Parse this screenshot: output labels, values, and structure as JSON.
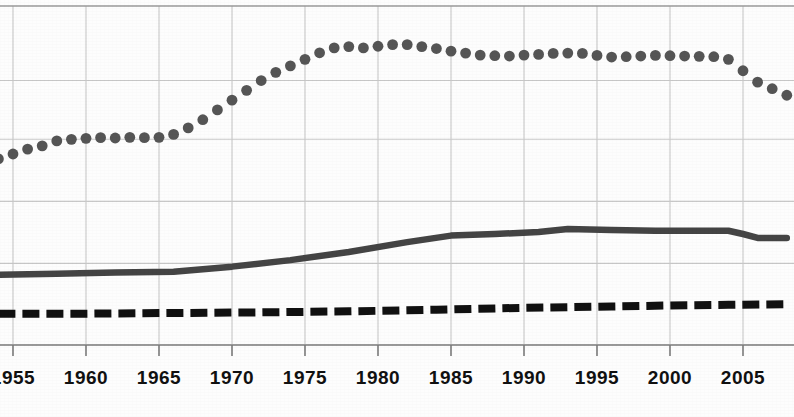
{
  "chart_data": {
    "type": "line",
    "title": "",
    "subtitle": "",
    "xlabel": "",
    "ylabel": "",
    "grid": true,
    "legend_position": "none",
    "xlim": [
      1953.5,
      2008.5
    ],
    "ylim": [
      0,
      100
    ],
    "x_tick_labels": [
      "1955",
      "1960",
      "1965",
      "1970",
      "1975",
      "1980",
      "1985",
      "1990",
      "1995",
      "2000",
      "2005"
    ],
    "x_tick_values": [
      1955,
      1960,
      1965,
      1970,
      1975,
      1980,
      1985,
      1990,
      1995,
      2000,
      2005
    ],
    "y_gridline_values": [
      25,
      44,
      63,
      81
    ],
    "series": [
      {
        "name": "dotted-series",
        "style": "dotted",
        "marker": "circle",
        "color": "#555555",
        "x": [
          1954,
          1955,
          1956,
          1957,
          1958,
          1959,
          1960,
          1961,
          1962,
          1963,
          1964,
          1965,
          1966,
          1967,
          1968,
          1969,
          1970,
          1971,
          1972,
          1973,
          1974,
          1975,
          1976,
          1977,
          1978,
          1979,
          1980,
          1981,
          1982,
          1983,
          1984,
          1985,
          1986,
          1987,
          1988,
          1989,
          1990,
          1991,
          1992,
          1993,
          1994,
          1995,
          1996,
          1997,
          1998,
          1999,
          2000,
          2001,
          2002,
          2003,
          2004,
          2005,
          2006,
          2007,
          2008
        ],
        "values": [
          57.0,
          58.5,
          60.0,
          61.0,
          62.5,
          63.0,
          63.3,
          63.5,
          63.4,
          63.6,
          63.5,
          63.6,
          64.5,
          66.5,
          69.0,
          72.0,
          75.0,
          78.0,
          81.0,
          83.5,
          85.5,
          87.5,
          89.5,
          91.0,
          91.4,
          91.0,
          91.5,
          92.0,
          92.0,
          91.4,
          90.8,
          90.0,
          89.4,
          88.8,
          88.6,
          88.5,
          88.8,
          89.0,
          89.3,
          89.4,
          89.3,
          88.7,
          88.2,
          88.3,
          88.5,
          88.7,
          88.6,
          88.5,
          88.4,
          88.3,
          87.5,
          84.0,
          80.5,
          78.5,
          76.5
        ]
      },
      {
        "name": "solid-series",
        "style": "solid",
        "marker": "none",
        "color": "#444444",
        "x": [
          1954,
          1958,
          1962,
          1966,
          1970,
          1974,
          1978,
          1982,
          1985,
          1988,
          1991,
          1993,
          1996,
          1999,
          2002,
          2004,
          2005,
          2006,
          2008
        ],
        "values": [
          21.5,
          21.8,
          22.2,
          22.4,
          24.0,
          26.0,
          28.5,
          31.5,
          33.5,
          34.0,
          34.6,
          35.5,
          35.2,
          35.0,
          35.0,
          35.0,
          34.0,
          32.8,
          32.8
        ]
      },
      {
        "name": "dashed-series",
        "style": "dashed",
        "marker": "none",
        "color": "#111111",
        "x": [
          1954,
          1960,
          1966,
          1972,
          1978,
          1984,
          1990,
          1996,
          2000,
          2004,
          2008
        ],
        "values": [
          9.6,
          9.6,
          9.8,
          10.0,
          10.3,
          10.8,
          11.4,
          11.8,
          12.1,
          12.3,
          12.5
        ]
      }
    ]
  },
  "axis": {
    "tick_font_size": 19,
    "tick_color": "#111111"
  },
  "colors": {
    "background": "#fdfdfd",
    "grid": "#c8c8c8",
    "axis_line": "#9a9a9a",
    "dotted_series": "#555555",
    "solid_series": "#444444",
    "dashed_series": "#111111"
  }
}
